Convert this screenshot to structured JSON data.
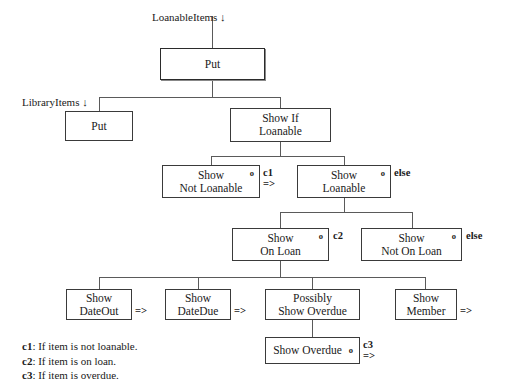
{
  "diagram": {
    "nodes": {
      "put_top": {
        "line1": "Put"
      },
      "put_library": {
        "line1": "Put"
      },
      "show_if_loanable": {
        "line1": "Show If",
        "line2": "Loanable"
      },
      "show_not_loanable": {
        "line1": "Show",
        "line2": "Not Loanable",
        "mark": "o"
      },
      "show_loanable": {
        "line1": "Show",
        "line2": "Loanable",
        "mark": "o"
      },
      "show_on_loan": {
        "line1": "Show",
        "line2": "On Loan",
        "mark": "o"
      },
      "show_not_on_loan": {
        "line1": "Show",
        "line2": "Not On Loan",
        "mark": "o"
      },
      "show_dateout": {
        "line1": "Show",
        "line2": "DateOut"
      },
      "show_datedue": {
        "line1": "Show",
        "line2": "DateDue"
      },
      "possibly_show_overdue": {
        "line1": "Possibly",
        "line2": "Show Overdue"
      },
      "show_member": {
        "line1": "Show",
        "line2": "Member"
      },
      "show_overdue": {
        "line1": "Show Overdue",
        "mark": "o"
      }
    },
    "flow_labels": {
      "loanable_items": "LoanableItems ↓",
      "library_items": "LibraryItems ↓"
    },
    "edge_labels": {
      "c1": "c1",
      "c1_arrow": "=>",
      "else1": "else",
      "c2": "c2",
      "else2": "else",
      "c3": "c3",
      "c3_arrow": "=>",
      "dateout_arrow": "=>",
      "datedue_arrow": "=>",
      "member_arrow": "=>"
    },
    "legend": [
      {
        "key": "c1",
        "text": ": If item is not loanable."
      },
      {
        "key": "c2",
        "text": ": If item is on loan."
      },
      {
        "key": "c3",
        "text": ": If item is overdue."
      }
    ],
    "colors": {
      "border": "#3a3a3a",
      "line": "#5a5a5a",
      "text": "#1a1a1a",
      "background": "#ffffff"
    }
  }
}
